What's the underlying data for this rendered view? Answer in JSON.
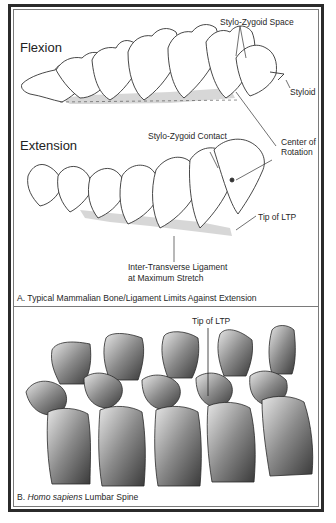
{
  "panel_a": {
    "flexion_heading": "Flexion",
    "extension_heading": "Extension",
    "labels": {
      "stylo_zygoid_space": "Stylo-Zygoid Space",
      "styloid": "Styloid",
      "stylo_zygoid_contact": "Stylo-Zygoid Contact",
      "center_of_rotation_line1": "Center of",
      "center_of_rotation_line2": "Rotation",
      "tip_of_ltp": "Tip of LTP",
      "ligament_line1": "Inter-Transverse Ligament",
      "ligament_line2": "at Maximum Stretch"
    },
    "caption": "A. Typical Mammalian Bone/Ligament Limits Against Extension"
  },
  "panel_b": {
    "label_tip_of_ltp": "Tip of LTP",
    "caption_prefix": "B. ",
    "caption_italic": "Homo sapiens",
    "caption_suffix": " Lumbar Spine"
  },
  "colors": {
    "frame": "#2b2b2b",
    "inner_line": "#7a7a7a",
    "bone_dark": "#3a3a3a",
    "bone_light": "#d9d9d9"
  }
}
